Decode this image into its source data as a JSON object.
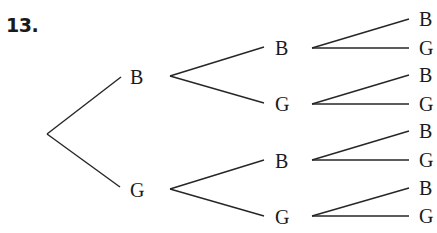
{
  "problem": {
    "number": "13."
  },
  "tree": {
    "level1": [
      {
        "label": "B"
      },
      {
        "label": "G"
      }
    ],
    "level2": [
      {
        "label": "B"
      },
      {
        "label": "G"
      },
      {
        "label": "B"
      },
      {
        "label": "G"
      }
    ],
    "level3": [
      {
        "label": "B"
      },
      {
        "label": "G"
      },
      {
        "label": "B"
      },
      {
        "label": "G"
      },
      {
        "label": "B"
      },
      {
        "label": "G"
      },
      {
        "label": "B"
      },
      {
        "label": "G"
      }
    ]
  }
}
